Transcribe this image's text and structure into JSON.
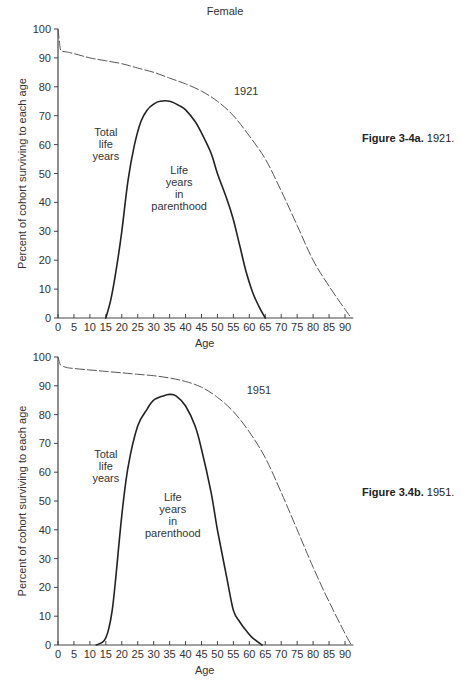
{
  "chart_data": [
    {
      "type": "line",
      "title": "Female",
      "caption_bold": "Figure 3-4a.",
      "caption_rest": "1921.",
      "xlabel": "Age",
      "ylabel": "Percent of cohort surviving to each age",
      "xlim": [
        0,
        92
      ],
      "ylim": [
        0,
        100
      ],
      "xticks": [
        0,
        5,
        10,
        15,
        20,
        25,
        30,
        35,
        40,
        45,
        50,
        55,
        60,
        65,
        70,
        75,
        80,
        85,
        90
      ],
      "yticks": [
        0,
        10,
        20,
        30,
        40,
        50,
        60,
        70,
        80,
        90,
        100
      ],
      "grid": false,
      "series": [
        {
          "name": "1921",
          "style": "dashed",
          "x": [
            0,
            0.5,
            1,
            3,
            5,
            10,
            15,
            20,
            25,
            30,
            35,
            40,
            45,
            50,
            55,
            60,
            65,
            70,
            75,
            80,
            85,
            90,
            92
          ],
          "y": [
            100,
            95,
            92.5,
            92,
            91.5,
            90,
            89,
            88,
            86.5,
            85,
            83,
            81,
            78.5,
            75,
            70,
            63,
            55,
            44,
            32,
            20,
            11,
            3,
            0
          ]
        },
        {
          "name": "Life years in parenthood",
          "style": "solid",
          "x": [
            15,
            16.5,
            18,
            20,
            22,
            24,
            26,
            28,
            30,
            32,
            35,
            38,
            40,
            43,
            45,
            48,
            50,
            53,
            55,
            57,
            59,
            61,
            63,
            65
          ],
          "y": [
            0,
            6,
            15,
            30,
            48,
            60,
            68,
            72,
            74,
            75,
            75,
            73.5,
            72,
            68,
            64,
            57,
            50,
            41,
            34,
            25,
            16,
            9,
            4,
            0
          ]
        }
      ],
      "annotations": [
        {
          "text_lines": [
            "Total",
            "life",
            "years"
          ],
          "x": 15,
          "y": 63
        },
        {
          "text_lines": [
            "Life",
            "years",
            "in",
            "parenthood"
          ],
          "x": 38,
          "y": 50
        },
        {
          "text_lines": [
            "1921"
          ],
          "x": 59,
          "y": 77
        }
      ]
    },
    {
      "type": "line",
      "title": "",
      "caption_bold": "Figure 3.4b.",
      "caption_rest": "1951.",
      "xlabel": "Age",
      "ylabel": "Percent of cohort surviving to each age",
      "xlim": [
        0,
        92
      ],
      "ylim": [
        0,
        100
      ],
      "xticks": [
        0,
        5,
        10,
        15,
        20,
        25,
        30,
        35,
        40,
        45,
        50,
        55,
        60,
        65,
        70,
        75,
        80,
        85,
        90
      ],
      "yticks": [
        0,
        10,
        20,
        30,
        40,
        50,
        60,
        70,
        80,
        90,
        100
      ],
      "grid": false,
      "series": [
        {
          "name": "1951",
          "style": "dashed",
          "x": [
            0,
            0.5,
            1,
            3,
            5,
            10,
            15,
            20,
            25,
            30,
            35,
            40,
            45,
            50,
            55,
            60,
            65,
            70,
            75,
            80,
            85,
            90,
            92
          ],
          "y": [
            100,
            98,
            97,
            96.3,
            96,
            95.5,
            95,
            94.5,
            94,
            93.5,
            92.7,
            91.5,
            89.5,
            86,
            81,
            74,
            65,
            53,
            40,
            27,
            15,
            4,
            0
          ]
        },
        {
          "name": "Life years in parenthood",
          "style": "solid",
          "x": [
            12,
            14,
            15,
            16,
            17,
            18,
            20,
            22,
            25,
            28,
            30,
            33,
            35,
            37,
            40,
            43,
            45,
            48,
            50,
            53,
            55,
            57,
            59,
            61,
            64
          ],
          "y": [
            0,
            1,
            2.5,
            6,
            12,
            22,
            45,
            62,
            76,
            82,
            85,
            86.5,
            87,
            86.5,
            83,
            76,
            68,
            53,
            40,
            23,
            12,
            8,
            5,
            2.5,
            0
          ]
        }
      ],
      "annotations": [
        {
          "text_lines": [
            "Total",
            "life",
            "years"
          ],
          "x": 15,
          "y": 65
        },
        {
          "text_lines": [
            "Life",
            "years",
            "in",
            "parenthood"
          ],
          "x": 36,
          "y": 50
        },
        {
          "text_lines": [
            "1951"
          ],
          "x": 63,
          "y": 87
        }
      ]
    }
  ]
}
